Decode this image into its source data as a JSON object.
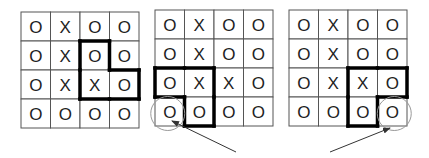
{
  "grids": [
    {
      "id": "grid-1",
      "cells": [
        [
          "O",
          "X",
          "O",
          "O"
        ],
        [
          "O",
          "X",
          "O",
          "O"
        ],
        [
          "O",
          "X",
          "X",
          "O"
        ],
        [
          "O",
          "O",
          "O",
          "O"
        ]
      ],
      "highlight": [
        [
          1,
          2
        ],
        [
          2,
          2
        ],
        [
          2,
          3
        ]
      ],
      "circled_cell": null,
      "arrow": false
    },
    {
      "id": "grid-2",
      "cells": [
        [
          "O",
          "X",
          "O",
          "O"
        ],
        [
          "O",
          "X",
          "O",
          "O"
        ],
        [
          "O",
          "X",
          "X",
          "O"
        ],
        [
          "O",
          "O",
          "O",
          "O"
        ]
      ],
      "highlight": [
        [
          2,
          0
        ],
        [
          2,
          1
        ],
        [
          3,
          1
        ]
      ],
      "circled_cell": [
        3,
        0
      ],
      "arrow": true
    },
    {
      "id": "grid-3",
      "cells": [
        [
          "O",
          "X",
          "O",
          "O"
        ],
        [
          "O",
          "X",
          "O",
          "O"
        ],
        [
          "O",
          "X",
          "X",
          "O"
        ],
        [
          "O",
          "O",
          "O",
          "O"
        ]
      ],
      "highlight": [
        [
          2,
          2
        ],
        [
          2,
          3
        ],
        [
          3,
          2
        ]
      ],
      "circled_cell": [
        3,
        3
      ],
      "arrow": true
    }
  ],
  "colors": {
    "grid_line": "#555555",
    "highlight_border": "#000000",
    "circle": "#999999",
    "arrow": "#333333",
    "text": "#222222"
  }
}
